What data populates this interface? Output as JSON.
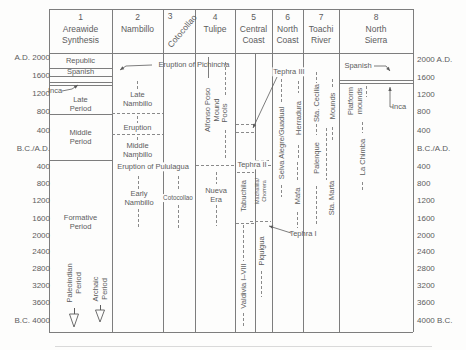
{
  "figure": {
    "colors": {
      "ink": "#5c5c5c",
      "line": "#8a8a8a",
      "frame": "#7d7d7d",
      "faint": "#d9d9d9",
      "bg": "#fdfdfc"
    },
    "canvas": {
      "w": 466,
      "h": 350
    },
    "columns": [
      {
        "num": "1",
        "title": [
          "Areawide",
          "Synthesis"
        ],
        "cx": 80.5
      },
      {
        "num": "2",
        "title": [
          "Nambillo"
        ],
        "cx": 137.5
      },
      {
        "num": "3",
        "title": [
          "Cotocollao"
        ],
        "cx": 179,
        "rotated": true,
        "num_x": 170,
        "num_y": 16,
        "title_cx": 182,
        "title_cy": 31
      },
      {
        "num": "4",
        "title": [
          "Tulipe"
        ],
        "cx": 215
      },
      {
        "num": "5",
        "title": [
          "Central",
          "Coast"
        ],
        "cx": 253.5
      },
      {
        "num": "6",
        "title": [
          "North",
          "Coast"
        ],
        "cx": 287.5
      },
      {
        "num": "7",
        "title": [
          "Toachi",
          "River"
        ],
        "cx": 321
      },
      {
        "num": "8",
        "title": [
          "North",
          "Sierra"
        ],
        "cx": 376
      }
    ],
    "axis_left": [
      {
        "label": "A.D. 2000",
        "y": 57
      },
      {
        "label": "1600",
        "y": 75
      },
      {
        "label": "1200",
        "y": 93
      },
      {
        "label": "800",
        "y": 111
      },
      {
        "label": "400",
        "y": 130
      },
      {
        "label": "B.C./A.D.",
        "y": 148
      },
      {
        "label": "400",
        "y": 166
      },
      {
        "label": "800",
        "y": 183
      },
      {
        "label": "1200",
        "y": 200
      },
      {
        "label": "1600",
        "y": 218
      },
      {
        "label": "2000",
        "y": 235
      },
      {
        "label": "2400",
        "y": 251
      },
      {
        "label": "2800",
        "y": 268
      },
      {
        "label": "3200",
        "y": 285
      },
      {
        "label": "3600",
        "y": 302
      },
      {
        "label": "B.C. 4000",
        "y": 320
      }
    ],
    "axis_right": [
      {
        "label": "2000 A.D.",
        "y": 59
      },
      {
        "label": "1600",
        "y": 77
      },
      {
        "label": "1200",
        "y": 94
      },
      {
        "label": "800",
        "y": 111
      },
      {
        "label": "400",
        "y": 130
      },
      {
        "label": "B.C./A.D.",
        "y": 148
      },
      {
        "label": "400",
        "y": 166
      },
      {
        "label": "800",
        "y": 183
      },
      {
        "label": "1200",
        "y": 200
      },
      {
        "label": "1600",
        "y": 218
      },
      {
        "label": "2000",
        "y": 235
      },
      {
        "label": "2400",
        "y": 251
      },
      {
        "label": "2800",
        "y": 268
      },
      {
        "label": "3200",
        "y": 285
      },
      {
        "label": "3600",
        "y": 302
      },
      {
        "label": "4000 B.C.",
        "y": 320
      }
    ],
    "solid_lines": [
      [
        49,
        9,
        413,
        9
      ],
      [
        49,
        332,
        413,
        332
      ],
      [
        49,
        9,
        49,
        332
      ],
      [
        413,
        9,
        413,
        332
      ],
      [
        49,
        53,
        413,
        53
      ],
      [
        112,
        9,
        112,
        332
      ],
      [
        163,
        9,
        163,
        332
      ],
      [
        195,
        9,
        195,
        332
      ],
      [
        235,
        9,
        235,
        332
      ],
      [
        272,
        9,
        272,
        332
      ],
      [
        303,
        9,
        303,
        332
      ],
      [
        339,
        9,
        339,
        332
      ],
      [
        255,
        53,
        255,
        332
      ],
      [
        49,
        68,
        112,
        68
      ],
      [
        49,
        76,
        112,
        76
      ],
      [
        49,
        82,
        112,
        82
      ],
      [
        49,
        85,
        112,
        85
      ],
      [
        49,
        114,
        112,
        114
      ],
      [
        49,
        160,
        112,
        160
      ],
      [
        339,
        80,
        413,
        80
      ],
      [
        339,
        83,
        413,
        83
      ],
      [
        208,
        57,
        208,
        78
      ]
    ],
    "dashed_lines": [
      [
        112,
        113,
        163,
        113
      ],
      [
        112,
        134,
        163,
        134
      ],
      [
        196,
        165,
        236,
        165
      ],
      [
        268,
        165,
        271,
        165
      ],
      [
        237,
        172,
        254,
        172
      ],
      [
        256,
        160,
        271,
        160
      ],
      [
        236,
        124,
        254,
        124
      ],
      [
        236,
        132,
        254,
        132
      ],
      [
        250,
        221,
        271,
        221
      ],
      [
        236,
        223,
        254,
        223
      ],
      [
        137,
        81,
        137,
        91
      ],
      [
        137,
        116,
        137,
        123
      ],
      [
        137,
        137,
        137,
        141
      ],
      [
        137,
        157,
        137,
        162
      ],
      [
        138,
        176,
        138,
        190
      ],
      [
        138,
        209,
        138,
        228
      ],
      [
        178,
        176,
        178,
        191
      ],
      [
        178,
        205,
        178,
        228
      ],
      [
        225,
        62,
        225,
        96
      ],
      [
        225,
        130,
        225,
        160
      ],
      [
        216,
        172,
        216,
        184
      ],
      [
        216,
        205,
        216,
        226
      ],
      [
        243,
        225,
        243,
        261
      ],
      [
        243,
        313,
        243,
        326
      ],
      [
        261,
        271,
        261,
        297
      ],
      [
        281,
        79,
        281,
        103
      ],
      [
        281,
        185,
        281,
        197
      ],
      [
        298,
        81,
        298,
        93
      ],
      [
        298,
        145,
        298,
        158
      ],
      [
        297,
        162,
        297,
        180
      ],
      [
        297,
        212,
        297,
        228
      ],
      [
        316,
        72,
        316,
        83
      ],
      [
        316,
        124,
        316,
        135
      ],
      [
        316,
        186,
        316,
        225
      ],
      [
        326,
        128,
        326,
        180
      ],
      [
        332,
        79,
        332,
        89
      ],
      [
        332,
        127,
        332,
        140
      ],
      [
        366,
        86,
        366,
        97
      ],
      [
        362,
        122,
        362,
        133
      ],
      [
        362,
        182,
        362,
        192
      ]
    ],
    "hlabels": [
      {
        "name": "republic-label",
        "text": "Republic",
        "x": 80.5,
        "y": 61
      },
      {
        "name": "spanish-label-col1",
        "text": "Spanish",
        "x": 80.5,
        "y": 72
      },
      {
        "name": "inca-label-col1",
        "text": "Inca",
        "x": 55,
        "y": 91
      },
      {
        "name": "late-period-label",
        "text": "Late\nPeriod",
        "x": 80.5,
        "y": 104
      },
      {
        "name": "middle-period-label",
        "text": "Middle\nPeriod",
        "x": 80.5,
        "y": 137
      },
      {
        "name": "formative-period-label",
        "text": "Formative\nPeriod",
        "x": 80.5,
        "y": 222
      },
      {
        "name": "late-nambillo-label",
        "text": "Late\nNambillo",
        "x": 137.5,
        "y": 99
      },
      {
        "name": "eruption-label",
        "text": "Eruption",
        "x": 137.5,
        "y": 128
      },
      {
        "name": "middle-nambillo-label",
        "text": "Middle\nNambillo",
        "x": 137.5,
        "y": 150
      },
      {
        "name": "pululagua-eruption-label",
        "text": "Eruption of Pululagua",
        "x": 153,
        "y": 167,
        "bg": true
      },
      {
        "name": "early-nambillo-label",
        "text": "Early\nNambillo",
        "x": 139,
        "y": 198
      },
      {
        "name": "cotocollao-phase-label",
        "text": "Cotocollao",
        "x": 178,
        "y": 198,
        "size": 6.3,
        "bg": true
      },
      {
        "name": "nueva-era-label",
        "text": "Nueva\nEra",
        "x": 216,
        "y": 195
      },
      {
        "name": "pichincha-eruption-label",
        "text": "Eruption of Pichincha",
        "x": 194,
        "y": 65
      },
      {
        "name": "tephra-2-label",
        "text": "Tephra II",
        "x": 252,
        "y": 165,
        "bg": true
      },
      {
        "name": "tephra-3-label",
        "text": "Tephra III",
        "x": 289,
        "y": 72,
        "bg": true
      },
      {
        "name": "tephra-1-label",
        "text": "Tephra I",
        "x": 303,
        "y": 234
      },
      {
        "name": "spanish-label-col8",
        "text": "Spanish",
        "x": 358,
        "y": 66
      },
      {
        "name": "inca-label-col8",
        "text": "Inca",
        "x": 399,
        "y": 107
      }
    ],
    "vlabels": [
      {
        "name": "alfonso-poso-mound-label",
        "lines": [
          "Alfonso Poso",
          "Mound"
        ],
        "cx": 211.5,
        "cy": 110
      },
      {
        "name": "pools-label",
        "lines": [
          "Pools"
        ],
        "cx": 224,
        "cy": 113
      },
      {
        "name": "tabuchila-label",
        "lines": [
          "Tabuchila"
        ],
        "cx": 243,
        "cy": 196
      },
      {
        "name": "machalilla-chorrera-label",
        "lines": [
          "Machalilla/",
          "Chorrera"
        ],
        "cx": 260.5,
        "cy": 191,
        "size": 5.5
      },
      {
        "name": "piquigua-label",
        "lines": [
          "Piquigua"
        ],
        "cx": 261,
        "cy": 251
      },
      {
        "name": "valdivia-label",
        "lines": [
          "Valdivia I–VIII"
        ],
        "cx": 243,
        "cy": 286
      },
      {
        "name": "selva-alegre-guadual-label",
        "lines": [
          "Selva Alegre/Guadual"
        ],
        "cx": 281,
        "cy": 143
      },
      {
        "name": "herradura-label",
        "lines": [
          "Herradura"
        ],
        "cx": 298,
        "cy": 118
      },
      {
        "name": "mafa-label",
        "lines": [
          "Mafa"
        ],
        "cx": 297,
        "cy": 196
      },
      {
        "name": "sta-cecilia-label",
        "lines": [
          "Sta. Cecilia"
        ],
        "cx": 316,
        "cy": 103
      },
      {
        "name": "palenque-label",
        "lines": [
          "Palenque"
        ],
        "cx": 316,
        "cy": 158
      },
      {
        "name": "mounds-label",
        "lines": [
          "Mounds"
        ],
        "cx": 332,
        "cy": 106
      },
      {
        "name": "sta-marta-label",
        "lines": [
          "Sta. Marta"
        ],
        "cx": 331,
        "cy": 198
      },
      {
        "name": "platform-mounds-label",
        "lines": [
          "Platform",
          "mounds"
        ],
        "cx": 355,
        "cy": 101
      },
      {
        "name": "la-chimba-label",
        "lines": [
          "La Chimba"
        ],
        "cx": 362,
        "cy": 157
      },
      {
        "name": "paleoindian-period-label",
        "lines": [
          "Paleoindian",
          "Period"
        ],
        "cx": 74,
        "cy": 283
      },
      {
        "name": "archaic-period-label",
        "lines": [
          "Archaic",
          "Period"
        ],
        "cx": 100,
        "cy": 289
      }
    ],
    "pointers": [
      {
        "name": "pichincha-pointer",
        "pts": [
          [
            152,
            65
          ],
          [
            126,
            66
          ],
          [
            120,
            70
          ]
        ]
      },
      {
        "name": "inca-col1-pointer",
        "pts": [
          [
            62,
            91
          ],
          [
            72,
            89
          ],
          [
            78,
            85
          ]
        ]
      },
      {
        "name": "tephra-3-pointer",
        "pts": [
          [
            277,
            77
          ],
          [
            253,
            128
          ]
        ]
      },
      {
        "name": "tephra-1-pointer",
        "pts": [
          [
            291,
            233
          ],
          [
            269,
            226
          ]
        ]
      },
      {
        "name": "spanish-col8-pointer",
        "pts": [
          [
            374,
            66
          ],
          [
            386,
            66
          ],
          [
            390,
            71
          ]
        ]
      },
      {
        "name": "inca-col8-pointer",
        "pts": [
          [
            393,
            107
          ],
          [
            390,
            107
          ],
          [
            390,
            87
          ]
        ]
      }
    ],
    "open_arrows": [
      {
        "name": "paleoindian-down-arrow",
        "x": 74,
        "shaft_top": 308,
        "base": 314,
        "tip": 327
      },
      {
        "name": "archaic-down-arrow",
        "x": 100,
        "shaft_top": 305,
        "base": 310,
        "tip": 322
      }
    ],
    "faint_rule": [
      55,
      346,
      432,
      346
    ]
  }
}
